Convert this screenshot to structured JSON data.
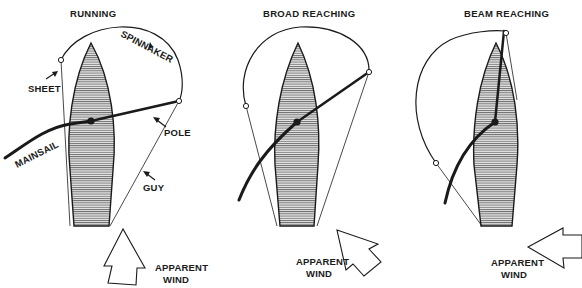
{
  "diagram": {
    "panels": [
      {
        "title": "RUNNING",
        "labels": {
          "spinnaker": "SPINNAKER",
          "sheet": "SHEET",
          "pole": "POLE",
          "mainsail": "MAINSAIL",
          "guy": "GUY"
        },
        "wind_label_1": "APPARENT",
        "wind_label_2": "WIND",
        "wind_direction": "from astern"
      },
      {
        "title": "BROAD REACHING",
        "wind_label_1": "APPARENT",
        "wind_label_2": "WIND",
        "wind_direction": "from quarter"
      },
      {
        "title": "BEAM REACHING",
        "wind_label_1": "APPARENT",
        "wind_label_2": "WIND",
        "wind_direction": "from beam"
      }
    ],
    "colors": {
      "ink": "#1a1a1a",
      "hull_hatch": "#555555",
      "background": "#ffffff"
    }
  }
}
